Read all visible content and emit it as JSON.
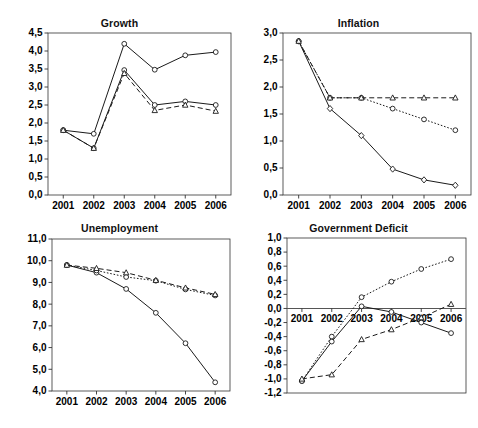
{
  "figure": {
    "panels": [
      "growth",
      "inflation",
      "unemployment",
      "government_deficit"
    ]
  },
  "titles": {
    "growth": "Growth",
    "inflation": "Inflation",
    "unemployment": "Unemployment",
    "government_deficit": "Government Deficit"
  },
  "chart_data": [
    {
      "type": "line",
      "id": "growth",
      "title": "Growth",
      "xlabel": "",
      "ylabel": "",
      "categories": [
        "2001",
        "2002",
        "2003",
        "2004",
        "2005",
        "2006"
      ],
      "x_tick_labels": [
        "2001",
        "2002",
        "2003",
        "2004",
        "2005",
        "2006"
      ],
      "y_tick_labels": [
        "0,0",
        "0,5",
        "1,0",
        "1,5",
        "2,0",
        "2,5",
        "3,0",
        "3,5",
        "4,0",
        "4,5"
      ],
      "ylim": [
        0.0,
        4.5
      ],
      "ytick_step": 0.5,
      "grid": false,
      "legend": "none",
      "series": [
        {
          "name": "series-1",
          "style": "solid",
          "marker": "circle",
          "values": [
            1.8,
            1.7,
            4.2,
            3.48,
            3.88,
            3.97
          ]
        },
        {
          "name": "series-2",
          "style": "solid",
          "marker": "circle",
          "values": [
            1.8,
            1.3,
            3.47,
            2.5,
            2.6,
            2.5
          ]
        },
        {
          "name": "series-3",
          "style": "dashed",
          "marker": "triangle",
          "values": [
            1.8,
            1.3,
            3.38,
            2.35,
            2.5,
            2.33
          ]
        }
      ]
    },
    {
      "type": "line",
      "id": "inflation",
      "title": "Inflation",
      "xlabel": "",
      "ylabel": "",
      "categories": [
        "2001",
        "2002",
        "2003",
        "2004",
        "2005",
        "2006"
      ],
      "x_tick_labels": [
        "2001",
        "2002",
        "2003",
        "2004",
        "2005",
        "2006"
      ],
      "y_tick_labels": [
        "0,0",
        "0,5",
        "1,0",
        "1,5",
        "2,0",
        "2,5",
        "3,0"
      ],
      "ylim": [
        0.0,
        3.0
      ],
      "ytick_step": 0.5,
      "grid": false,
      "legend": "none",
      "series": [
        {
          "name": "series-1",
          "style": "solid",
          "marker": "diamond",
          "values": [
            2.85,
            1.6,
            1.1,
            0.48,
            0.28,
            0.18
          ]
        },
        {
          "name": "series-2",
          "style": "dotted",
          "marker": "circle",
          "values": [
            2.85,
            1.8,
            1.8,
            1.6,
            1.4,
            1.2
          ]
        },
        {
          "name": "series-3",
          "style": "dashed",
          "marker": "triangle",
          "values": [
            2.85,
            1.8,
            1.8,
            1.8,
            1.8,
            1.8
          ]
        }
      ]
    },
    {
      "type": "line",
      "id": "unemployment",
      "title": "Unemployment",
      "xlabel": "",
      "ylabel": "",
      "categories": [
        "2001",
        "2002",
        "2003",
        "2004",
        "2005",
        "2006"
      ],
      "x_tick_labels": [
        "2001",
        "2002",
        "2003",
        "2004",
        "2005",
        "2006"
      ],
      "y_tick_labels": [
        "4,0",
        "5,0",
        "6,0",
        "7,0",
        "8,0",
        "9,0",
        "10,0",
        "11,0"
      ],
      "ylim": [
        4.0,
        11.0
      ],
      "ytick_step": 1.0,
      "grid": false,
      "legend": "none",
      "series": [
        {
          "name": "series-1",
          "style": "solid",
          "marker": "circle",
          "values": [
            9.8,
            9.45,
            8.7,
            7.6,
            6.2,
            4.4
          ]
        },
        {
          "name": "series-2",
          "style": "dotted",
          "marker": "circle",
          "values": [
            9.8,
            9.55,
            9.25,
            9.08,
            8.68,
            8.4
          ]
        },
        {
          "name": "series-3",
          "style": "dashed",
          "marker": "triangle",
          "values": [
            9.8,
            9.65,
            9.45,
            9.1,
            8.75,
            8.45
          ]
        }
      ]
    },
    {
      "type": "line",
      "id": "government_deficit",
      "title": "Government Deficit",
      "xlabel": "",
      "ylabel": "",
      "categories": [
        "2001",
        "2002",
        "2003",
        "2004",
        "2005",
        "2006"
      ],
      "x_tick_labels": [
        "2001",
        "2002",
        "2003",
        "2004",
        "2005",
        "2006"
      ],
      "y_tick_labels": [
        "-1,2",
        "-1,0",
        "-0,8",
        "-0,6",
        "-0,4",
        "-0,2",
        "0,0",
        "0,2",
        "0,4",
        "0,6",
        "0,8",
        "1,0"
      ],
      "ylim": [
        -1.2,
        1.0
      ],
      "ytick_step": 0.2,
      "grid": false,
      "zero_line": true,
      "legend": "none",
      "series": [
        {
          "name": "series-1",
          "style": "dotted",
          "marker": "circle",
          "values": [
            -1.03,
            -0.4,
            0.16,
            0.38,
            0.56,
            0.7
          ]
        },
        {
          "name": "series-2",
          "style": "solid",
          "marker": "circle",
          "values": [
            -1.03,
            -0.47,
            0.03,
            -0.05,
            -0.2,
            -0.35
          ]
        },
        {
          "name": "series-3",
          "style": "dashed",
          "marker": "triangle",
          "values": [
            -1.0,
            -0.94,
            -0.44,
            -0.3,
            -0.13,
            0.06
          ]
        }
      ]
    }
  ],
  "colors": {
    "line": "#1a1a1a",
    "axis": "#333333",
    "text": "#000000",
    "background": "#ffffff"
  }
}
